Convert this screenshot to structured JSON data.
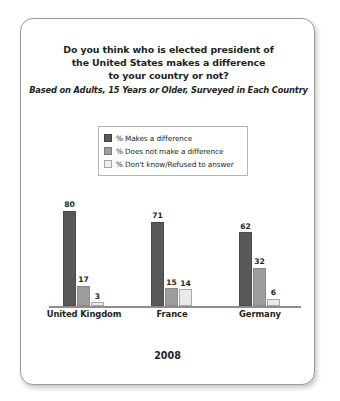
{
  "chart_data": {
    "type": "bar",
    "title": "Do you think who is elected president of the United States makes a difference to your country or not?",
    "title_lines": [
      "Do you think who is elected president of",
      "the United States makes a difference",
      "to your country or not?"
    ],
    "subtitle": "Based on Adults, 15 Years or Older, Surveyed in Each Country",
    "xlabel": "2008",
    "ylabel": "",
    "ylim": [
      0,
      100
    ],
    "grid": false,
    "legend_position": "top-center",
    "categories": [
      "United Kingdom",
      "France",
      "Germany"
    ],
    "series": [
      {
        "name": "% Makes a difference",
        "color": "#585858",
        "values": [
          80,
          71,
          62
        ]
      },
      {
        "name": "% Does not make a difference",
        "color": "#9d9d9d",
        "values": [
          17,
          15,
          32
        ]
      },
      {
        "name": "% Don't know/Refused to answer",
        "color": "#e9e9e9",
        "values": [
          3,
          14,
          6
        ]
      }
    ]
  },
  "footer": {
    "year": "2008"
  }
}
